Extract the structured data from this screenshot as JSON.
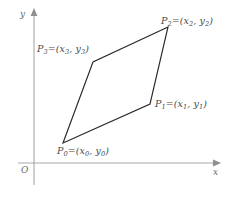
{
  "figure": {
    "background_color": "#ffffff",
    "shape_stroke_color": "#2a2a2a",
    "axis_color": "#a8a8a8",
    "label_color": "#4a4a4a"
  },
  "axes": {
    "x_label": "x",
    "y_label": "y",
    "origin_label": "O",
    "x_axis_name": "horizontal-axis",
    "y_axis_name": "vertical-axis",
    "x_arrow_icon": "arrow-right-icon",
    "y_arrow_icon": "arrow-up-icon"
  },
  "vertices": [
    {
      "id": "P0",
      "point_label": "P",
      "index": "0",
      "equals": "=(",
      "x_var": "x",
      "y_var": "y",
      "close": ")",
      "label_text": "P0=(x0, y0)",
      "px": 63,
      "py": 143
    },
    {
      "id": "P1",
      "point_label": "P",
      "index": "1",
      "equals": "=(",
      "x_var": "x",
      "y_var": "y",
      "close": ")",
      "label_text": "P1=(x1, y1)",
      "px": 150,
      "py": 104
    },
    {
      "id": "P2",
      "point_label": "P",
      "index": "2",
      "equals": "=(",
      "x_var": "x",
      "y_var": "y",
      "close": ")",
      "label_text": "P2=(x2, y2)",
      "px": 168,
      "py": 27
    },
    {
      "id": "P3",
      "point_label": "P",
      "index": "3",
      "equals": "=(",
      "x_var": "x",
      "y_var": "y",
      "close": ")",
      "label_text": "P3=(x3, y3)",
      "px": 93,
      "py": 62
    }
  ],
  "geometry": {
    "polygon_points": "63,143 150,104 168,27 93,62",
    "x_axis_path": "M18,163 L215,163",
    "y_axis_path": "M34,14 L34,185",
    "x_arrow_points": "221,163 213,159.6 213,166.4",
    "y_arrow_points": "34,8 30.6,16 37.4,16"
  }
}
